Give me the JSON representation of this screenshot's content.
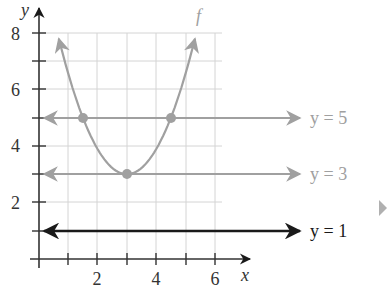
{
  "chart_data": {
    "type": "line",
    "title": "",
    "xlabel": "x",
    "ylabel": "y",
    "xlim": [
      0,
      6.3
    ],
    "ylim": [
      0,
      8
    ],
    "grid": true,
    "x_ticks": [
      1,
      2,
      3,
      4,
      5,
      6
    ],
    "x_tick_labels": [
      "2",
      "4",
      "6"
    ],
    "y_ticks": [
      1,
      2,
      3,
      4,
      5,
      6,
      7,
      8
    ],
    "y_tick_labels": [
      "2",
      "4",
      "6",
      "8"
    ],
    "series": [
      {
        "name": "f",
        "kind": "parabola",
        "equation": "f(x) = (8/9)(x - 3)^2 + 3",
        "vertex": [
          3,
          3
        ],
        "points": [
          [
            1.5,
            5
          ],
          [
            3,
            3
          ],
          [
            4.5,
            5
          ]
        ],
        "color": "#a0a0a0"
      },
      {
        "name": "y = 5",
        "kind": "horizontal-line",
        "y": 5,
        "color": "#a0a0a0"
      },
      {
        "name": "y = 3",
        "kind": "horizontal-line",
        "y": 3,
        "color": "#a0a0a0"
      },
      {
        "name": "y = 1",
        "kind": "horizontal-line",
        "y": 1,
        "color": "#1a1a1a"
      }
    ],
    "marked_points": [
      [
        1.5,
        5
      ],
      [
        4.5,
        5
      ],
      [
        3,
        3
      ]
    ],
    "annotations": {
      "curve_label": "f",
      "line_labels": [
        "y = 5",
        "y = 3",
        "y = 1"
      ]
    }
  },
  "labels": {
    "x_axis": "x",
    "y_axis": "y",
    "curve": "f",
    "line5": "y = 5",
    "line3": "y = 3",
    "line1": "y = 1",
    "tick_x2": "2",
    "tick_x4": "4",
    "tick_x6": "6",
    "tick_y2": "2",
    "tick_y4": "4",
    "tick_y6": "6",
    "tick_y8": "8"
  }
}
